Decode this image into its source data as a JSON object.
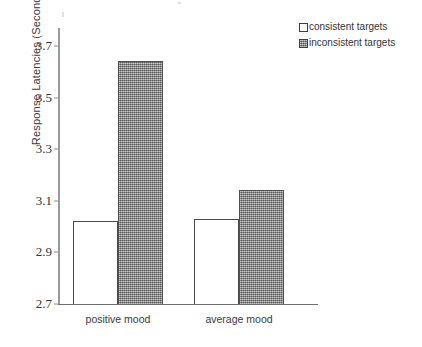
{
  "chart_data": {
    "type": "bar",
    "title": "",
    "subtitle": "",
    "xlabel": "",
    "ylabel": "Response Latencies (Seconds)",
    "categories": [
      "positive mood",
      "average mood"
    ],
    "series": [
      {
        "name": "consistent targets",
        "values": [
          3.02,
          3.03
        ],
        "color": "#ffffff",
        "style": "outlined"
      },
      {
        "name": "inconsistent targets",
        "values": [
          3.64,
          3.14
        ],
        "color": "#8d8d8d",
        "style": "hatched"
      }
    ],
    "ylim": [
      2.7,
      3.7
    ],
    "yticks": [
      "2.7",
      "2.9",
      "3.1",
      "3.3",
      "3.5",
      "3.7"
    ],
    "ytick_values": [
      2.7,
      2.9,
      3.1,
      3.3,
      3.5,
      3.7
    ],
    "grid": false,
    "legend_position": "top-right",
    "axis_color": "#8d8d8d",
    "text_color": "#333333"
  },
  "legend": {
    "items": [
      {
        "label": "consistent targets",
        "swatch": "white-square"
      },
      {
        "label": "inconsistent targets",
        "swatch": "gray-hatched-square"
      }
    ]
  }
}
